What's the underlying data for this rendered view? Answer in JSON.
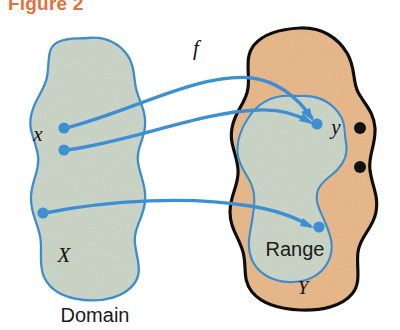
{
  "figure": {
    "title": "Figure 2",
    "title_color": "#e2703a"
  },
  "diagram": {
    "type": "function-mapping-diagram",
    "domain_shape": {
      "name": "Domain set X",
      "fill_color": "#ccd6c8",
      "stroke_color": "#3d8fd1",
      "inner_label": "X",
      "caption": "Domain"
    },
    "codomain_shape": {
      "name": "Codomain set Y",
      "fill_color": "#e8b98c",
      "stroke_color": "#111111",
      "inner_label": "Y"
    },
    "range_shape": {
      "name": "Range subset",
      "fill_color": "#ccd6c8",
      "stroke_color": "#3d8fd1",
      "inner_label": "Range"
    },
    "function_label": "f",
    "function_label_color": "#111111",
    "arrow_color": "#3d8fd1",
    "point_color": "#3d8fd1",
    "extra_point_color": "#111111",
    "domain_points": [
      {
        "label": "x",
        "show_label": true
      },
      {
        "label": "",
        "show_label": false
      },
      {
        "label": "",
        "show_label": false
      }
    ],
    "range_points": [
      {
        "label": "y",
        "show_label": true
      },
      {
        "label": "",
        "show_label": false
      }
    ],
    "extra_points_count": 2
  }
}
